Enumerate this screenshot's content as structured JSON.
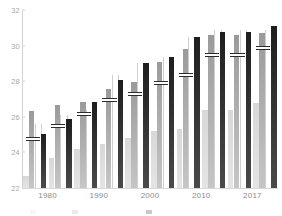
{
  "chart_data": {
    "type": "bar",
    "title": "",
    "subtitle": "",
    "xlabel": "",
    "ylabel": "",
    "ylim": [
      22,
      32
    ],
    "ytick_values": [
      22,
      24,
      26,
      28,
      30,
      32
    ],
    "ytick_labels": [
      "22",
      "24",
      "26",
      "28",
      "30",
      "32"
    ],
    "grid": false,
    "legend_position": "bottom",
    "legend_visible": false,
    "categories": [
      "1980",
      "1985",
      "1990",
      "1995",
      "2000",
      "2005",
      "2010",
      "2015",
      "2017",
      "2017b"
    ],
    "tick_categories": [
      "1980",
      "1990",
      "2000",
      "2010",
      "2017"
    ],
    "series": [
      {
        "name": "series-1",
        "color": "#dcdcdc",
        "values": [
          22.7,
          23.7,
          24.2,
          24.5,
          24.8,
          25.2,
          25.3,
          26.4,
          26.4,
          26.8
        ]
      },
      {
        "name": "series-2",
        "color": "#adadad",
        "values": [
          26.35,
          26.65,
          26.85,
          27.55,
          27.95,
          29.1,
          29.8,
          30.6,
          30.6,
          30.7
        ]
      },
      {
        "name": "series-3",
        "color": "#ffffff",
        "values": [
          25.6,
          26.1,
          26.4,
          28.35,
          29.05,
          29.35,
          30.5,
          30.9,
          30.9,
          30.85
        ]
      },
      {
        "name": "series-4",
        "color": "#262626",
        "values": [
          25.05,
          25.85,
          26.85,
          28.05,
          29.05,
          29.35,
          30.5,
          30.75,
          30.75,
          31.1
        ]
      }
    ],
    "markers": {
      "name": "mean-marker",
      "color": "#ffffff",
      "values": [
        24.75,
        25.5,
        26.15,
        26.95,
        27.3,
        27.9,
        28.35,
        29.5,
        29.5,
        29.85
      ]
    }
  }
}
